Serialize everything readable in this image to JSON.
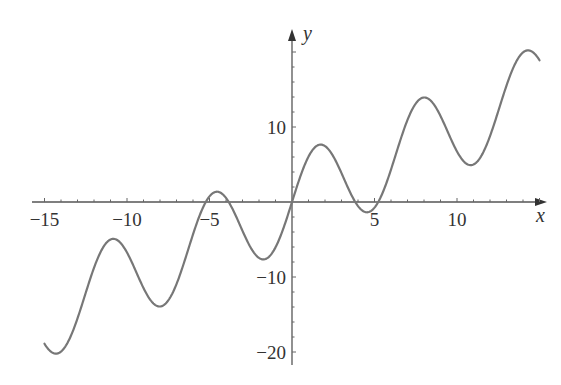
{
  "chart_data": {
    "type": "line",
    "title": "",
    "function": "y = x + 6 sin(x)",
    "xlabel": "x",
    "ylabel": "y",
    "xlim": [
      -15,
      15
    ],
    "ylim": [
      -21,
      23
    ],
    "grid": false,
    "legend": null,
    "x_ticks": [
      -15,
      -10,
      -5,
      5,
      10
    ],
    "x_tick_labels": [
      "−15",
      "−10",
      "−5",
      "5",
      "10"
    ],
    "y_ticks": [
      10,
      -10,
      -20
    ],
    "y_tick_labels": [
      "10",
      "−10",
      "−20"
    ],
    "minor_tick_step_x": 1,
    "minor_tick_step_y": 2,
    "line_color": "#777777",
    "axis_color": "#555555",
    "series": [
      {
        "name": "x + 6 sin x",
        "x": [
          -15,
          -14.3,
          -13,
          -12,
          -11,
          -10.83,
          -10,
          -9,
          -8.02,
          -7,
          -6,
          -5,
          -4.45,
          -4,
          -3,
          -2,
          -1.74,
          -1,
          0,
          1,
          1.74,
          2,
          3,
          4,
          4.55,
          5,
          6,
          7,
          8.02,
          9,
          10,
          10.83,
          11,
          12,
          13,
          14,
          14.3,
          15
        ],
        "y": [
          -18.9,
          -20.2,
          -15.5,
          -8.8,
          -5.0,
          -4.9,
          -6.7,
          -11.5,
          -13.9,
          -10.9,
          -4.3,
          0.75,
          1.37,
          0.54,
          -3.8,
          -7.5,
          -7.66,
          -6.0,
          0.0,
          6.0,
          7.66,
          7.5,
          3.8,
          -0.54,
          -1.37,
          -0.75,
          4.3,
          10.9,
          13.9,
          11.5,
          6.7,
          4.9,
          5.0,
          8.8,
          15.5,
          19.9,
          20.2,
          18.9
        ]
      }
    ]
  },
  "labels": {
    "x_axis": "x",
    "y_axis": "y"
  }
}
